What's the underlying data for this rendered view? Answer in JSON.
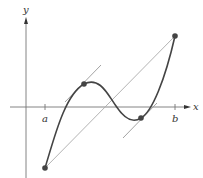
{
  "diagram": {
    "axes": {
      "x_label": "x",
      "y_label": "y"
    },
    "ticks": [
      {
        "label": "a"
      },
      {
        "label": "b"
      }
    ],
    "colors": {
      "curve": "#444444",
      "axes": "#777777",
      "secant": "#aaaaaa",
      "tangent": "#999999",
      "points": "#444444"
    },
    "elements": [
      "curve f(x) from a to b",
      "secant line between endpoints",
      "two tangent lines parallel to secant",
      "four marked points"
    ]
  }
}
